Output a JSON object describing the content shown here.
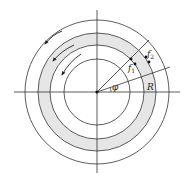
{
  "diagram": {
    "title": "",
    "labels": {
      "f1": "f",
      "f1_sub": "1",
      "f2": "f",
      "f2_sub": "2",
      "R": "R",
      "phi": "φ"
    },
    "colors": {
      "line": "#333333",
      "band": "#e6e6e6",
      "background": "#ffffff"
    },
    "geometry": {
      "center": [
        97,
        92
      ],
      "radii": [
        33,
        47,
        59,
        72
      ],
      "shaded_band": [
        47,
        59
      ],
      "radial_angles_deg": [
        45,
        19
      ]
    },
    "arrows": [
      {
        "name": "outer-rotation-arrow",
        "direction": "counterclockwise"
      },
      {
        "name": "middle-rotation-arrow",
        "direction": "counterclockwise"
      },
      {
        "name": "inner-rotation-arrow",
        "direction": "counterclockwise"
      }
    ]
  }
}
